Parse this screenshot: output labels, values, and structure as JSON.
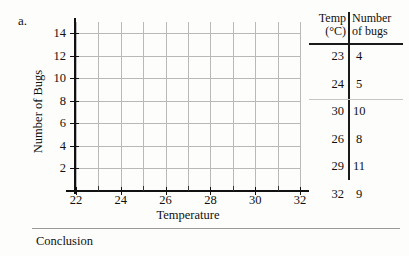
{
  "item_letter": "a.",
  "conclusion": {
    "label": "Conclusion"
  },
  "table": {
    "header": {
      "col1_line1": "Temp",
      "col1_line2": "(°C)",
      "col2_line1": "Number",
      "col2_line2": "of bugs"
    },
    "rows": [
      {
        "temp": "23",
        "bugs": "4"
      },
      {
        "temp": "24",
        "bugs": "5"
      },
      {
        "temp": "30",
        "bugs": "10"
      },
      {
        "temp": "26",
        "bugs": "8"
      },
      {
        "temp": "29",
        "bugs": "11"
      },
      {
        "temp": "32",
        "bugs": "9"
      }
    ]
  },
  "chart_data": {
    "type": "scatter",
    "title": "",
    "xlabel": "Temperature",
    "ylabel": "Number of Bugs",
    "xlim": [
      22,
      32
    ],
    "ylim": [
      0,
      15
    ],
    "x_major_ticks": [
      22,
      24,
      26,
      28,
      30,
      32
    ],
    "x_minor_ticks": [
      23,
      25,
      27,
      29,
      31
    ],
    "y_ticks": [
      2,
      4,
      6,
      8,
      10,
      12,
      14
    ],
    "x_tick_labels": [
      "22",
      "24",
      "26",
      "28",
      "30",
      "32"
    ],
    "y_tick_labels": [
      "2",
      "4",
      "6",
      "8",
      "10",
      "12",
      "14"
    ],
    "grid": true,
    "grid_x_step": 1,
    "grid_y_step": 2,
    "legend": null,
    "plotted": false,
    "note": "Blank worksheet grid — no data points plotted; values to be graphed are listed in the adjacent table.",
    "x": [
      23,
      24,
      30,
      26,
      29,
      32
    ],
    "y": [
      4,
      5,
      10,
      8,
      11,
      9
    ],
    "series": [
      {
        "name": "Number of bugs vs Temperature",
        "points": [
          {
            "x": 23,
            "y": 4
          },
          {
            "x": 24,
            "y": 5
          },
          {
            "x": 30,
            "y": 10
          },
          {
            "x": 26,
            "y": 8
          },
          {
            "x": 29,
            "y": 11
          },
          {
            "x": 32,
            "y": 9
          }
        ]
      }
    ]
  }
}
